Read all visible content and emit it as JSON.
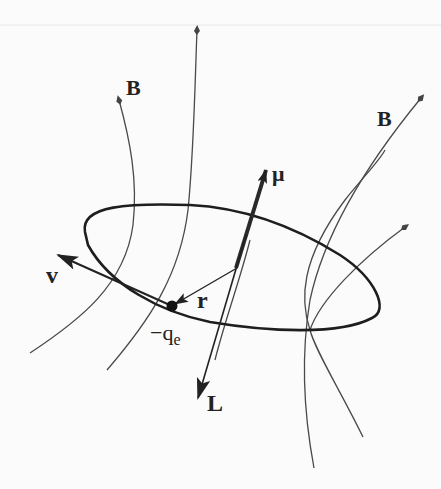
{
  "diagram": {
    "labels": {
      "field_left": "B",
      "field_right": "B",
      "moment": "μ",
      "velocity": "v",
      "radius": "r",
      "charge_main": "−q",
      "charge_sub": "e",
      "angular_momentum": "L"
    },
    "elements": [
      {
        "id": "orbit",
        "type": "ellipse"
      },
      {
        "id": "charge",
        "type": "point"
      },
      {
        "id": "mu-vector",
        "type": "arrow",
        "label": "μ"
      },
      {
        "id": "L-vector",
        "type": "arrow",
        "label": "L"
      },
      {
        "id": "r-vector",
        "type": "arrow",
        "label": "r"
      },
      {
        "id": "v-vector",
        "type": "arrow",
        "label": "v"
      },
      {
        "id": "field-lines",
        "type": "curves",
        "count": 6,
        "label": "B"
      }
    ],
    "colors": {
      "stroke": "#2a2a2a",
      "field": "#555555",
      "background": "#fbfbfb"
    }
  }
}
